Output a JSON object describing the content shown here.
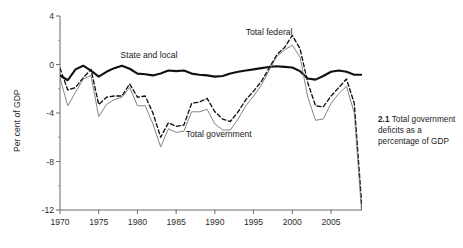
{
  "caption": {
    "number": "2.1",
    "text": " Total government deficits as a percentage of GDP"
  },
  "chart_data": {
    "type": "line",
    "title": "",
    "xlabel": "",
    "ylabel": "Per cent of GDP",
    "xlim": [
      1970,
      2009
    ],
    "ylim": [
      -12,
      4
    ],
    "xticks": [
      1970,
      1975,
      1980,
      1985,
      1990,
      1995,
      2000,
      2005
    ],
    "xticklabels": [
      "1970",
      "1975",
      "1980",
      "1985",
      "1990",
      "1995",
      "2000",
      "2005"
    ],
    "yticks": [
      4,
      0,
      -4,
      -8,
      -12
    ],
    "yticklabels": [
      "4",
      "0",
      "-4",
      "-8",
      "-12"
    ],
    "yminorticks": [
      2,
      -2,
      -6,
      -10
    ],
    "grid": false,
    "legend": "inline-annotations",
    "annotations": [
      {
        "label": "State and local",
        "x": 1981.5,
        "y": 0.55
      },
      {
        "label": "Total federal",
        "x": 1997.0,
        "y": 2.45
      },
      {
        "label": "Total government",
        "x": 1990.5,
        "y": -5.95
      }
    ],
    "x": [
      1970,
      1971,
      1972,
      1973,
      1974,
      1975,
      1976,
      1977,
      1978,
      1979,
      1980,
      1981,
      1982,
      1983,
      1984,
      1985,
      1986,
      1987,
      1988,
      1989,
      1990,
      1991,
      1992,
      1993,
      1994,
      1995,
      1996,
      1997,
      1998,
      1999,
      2000,
      2001,
      2002,
      2003,
      2004,
      2005,
      2006,
      2007,
      2008,
      2009
    ],
    "series": [
      {
        "name": "State and local",
        "style": "thick-solid",
        "color": "#111111",
        "values": [
          -0.9,
          -1.3,
          -0.4,
          -0.1,
          -0.5,
          -1.0,
          -0.6,
          -0.3,
          -0.1,
          -0.35,
          -0.75,
          -0.8,
          -0.9,
          -0.75,
          -0.5,
          -0.55,
          -0.5,
          -0.75,
          -0.85,
          -0.9,
          -1.0,
          -0.95,
          -0.75,
          -0.6,
          -0.5,
          -0.4,
          -0.3,
          -0.2,
          -0.15,
          -0.2,
          -0.25,
          -0.55,
          -1.15,
          -1.25,
          -0.95,
          -0.6,
          -0.5,
          -0.6,
          -0.85,
          -0.85
        ]
      },
      {
        "name": "Total federal",
        "style": "dashed",
        "color": "#111111",
        "values": [
          -0.3,
          -2.1,
          -1.9,
          -1.1,
          -0.4,
          -3.3,
          -2.7,
          -2.6,
          -2.6,
          -1.6,
          -2.7,
          -2.6,
          -4.0,
          -6.0,
          -4.8,
          -5.1,
          -5.0,
          -3.2,
          -3.1,
          -2.8,
          -3.9,
          -4.5,
          -4.7,
          -3.9,
          -2.9,
          -2.2,
          -1.4,
          -0.3,
          0.8,
          1.4,
          2.4,
          1.3,
          -1.5,
          -3.4,
          -3.5,
          -2.6,
          -1.9,
          -1.2,
          -3.2,
          -11.9
        ]
      },
      {
        "name": "Total government",
        "style": "thin-solid",
        "color": "#6f6f6f",
        "values": [
          -1.1,
          -3.4,
          -2.3,
          -1.2,
          -0.9,
          -4.3,
          -3.3,
          -2.9,
          -2.7,
          -1.9,
          -3.4,
          -3.4,
          -4.9,
          -6.8,
          -5.3,
          -5.6,
          -5.5,
          -3.9,
          -3.9,
          -3.7,
          -4.9,
          -5.4,
          -5.4,
          -4.5,
          -3.4,
          -2.6,
          -1.7,
          -0.5,
          0.65,
          1.2,
          1.6,
          0.6,
          -2.7,
          -4.6,
          -4.5,
          -3.2,
          -2.4,
          -1.8,
          -4.0,
          -12.6
        ]
      }
    ]
  }
}
